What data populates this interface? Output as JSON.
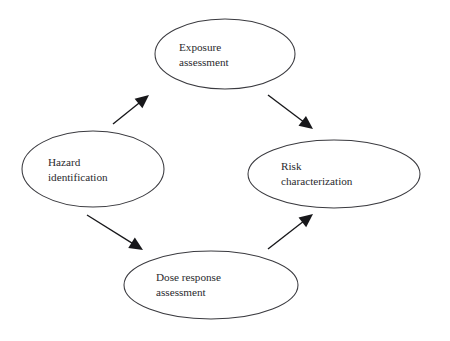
{
  "diagram": {
    "background_color": "#ffffff",
    "node_stroke_color": "#3a3a3f",
    "arrow_color": "#17171a",
    "text_color": "#2a2a2e",
    "nodes": [
      {
        "id": "exposure-assessment",
        "name": "exposure-assessment-node",
        "line1": "Exposure",
        "line2": "assessment",
        "cx": 225,
        "cy": 54,
        "rx": 70,
        "ry": 35,
        "text_x": 179,
        "text_y": 40
      },
      {
        "id": "hazard-identification",
        "name": "hazard-identification-node",
        "line1": "Hazard",
        "line2": "identification",
        "cx": 93,
        "cy": 169,
        "rx": 71,
        "ry": 38,
        "text_x": 48,
        "text_y": 155
      },
      {
        "id": "risk-characterization",
        "name": "risk-characterization-node",
        "line1": "Risk",
        "line2": "characterization",
        "cx": 334,
        "cy": 174,
        "rx": 86,
        "ry": 34,
        "text_x": 281,
        "text_y": 159
      },
      {
        "id": "dose-response-assessment",
        "name": "dose-response-assessment-node",
        "line1": "Dose response",
        "line2": "assessment",
        "cx": 211,
        "cy": 285,
        "rx": 87,
        "ry": 34,
        "text_x": 156,
        "text_y": 270
      }
    ],
    "arrows": [
      {
        "id": "hazard-to-exposure",
        "name": "arrow-hazard-to-exposure",
        "from": "hazard-identification",
        "to": "exposure-assessment",
        "x1": 113,
        "y1": 124,
        "x2": 149,
        "y2": 95
      },
      {
        "id": "exposure-to-risk",
        "name": "arrow-exposure-to-risk",
        "from": "exposure-assessment",
        "to": "risk-characterization",
        "x1": 268,
        "y1": 95,
        "x2": 313,
        "y2": 129
      },
      {
        "id": "hazard-to-dose-response",
        "name": "arrow-hazard-to-dose-response",
        "from": "hazard-identification",
        "to": "dose-response-assessment",
        "x1": 87,
        "y1": 215,
        "x2": 143,
        "y2": 250
      },
      {
        "id": "dose-response-to-risk",
        "name": "arrow-dose-response-to-risk",
        "from": "dose-response-assessment",
        "to": "risk-characterization",
        "x1": 268,
        "y1": 249,
        "x2": 313,
        "y2": 214
      }
    ]
  }
}
